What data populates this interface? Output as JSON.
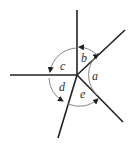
{
  "diagram": {
    "type": "angles-around-point",
    "labels": {
      "a": "a",
      "b": "b",
      "c": "c",
      "d": "d",
      "e": "e"
    }
  }
}
